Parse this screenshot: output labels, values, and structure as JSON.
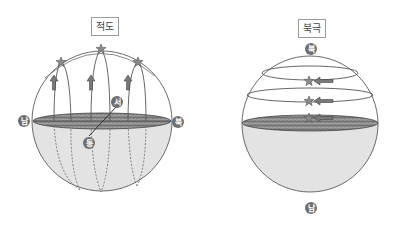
{
  "diagrams": [
    {
      "title": "적도",
      "labels": {
        "south": "남",
        "north": "북",
        "west": "서",
        "east": "동"
      },
      "description": "Stars rise vertically at the equator"
    },
    {
      "title": "북극",
      "labels": {
        "north": "북",
        "south": "남"
      },
      "description": "Stars move in circles parallel to the horizon at the North Pole"
    }
  ],
  "colors": {
    "sphere_outline": "#6a6a6a",
    "lower_hemisphere": "#e2e2e2",
    "horizon_fill": "#8a8a8a",
    "star": "#8c8c8c",
    "arrow": "#7a7a7a",
    "label_circle": "#6e6e6e"
  }
}
